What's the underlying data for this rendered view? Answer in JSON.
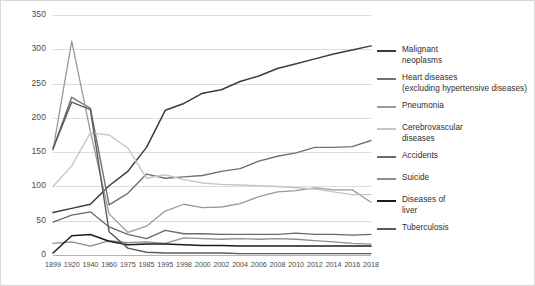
{
  "chart_data": {
    "type": "line",
    "title": "",
    "subtitle": "",
    "xlabel": "",
    "ylabel": "",
    "ylim": [
      0,
      350
    ],
    "yticks": [
      0,
      50,
      100,
      150,
      200,
      250,
      300,
      350
    ],
    "ytick_labels": [
      "0",
      "50",
      "100",
      "150",
      "200",
      "250",
      "300",
      "350"
    ],
    "grid": true,
    "legend_position": "right",
    "x": [
      1899,
      1920,
      1940,
      1960,
      1975,
      1985,
      1995,
      1998,
      2000,
      2002,
      2004,
      2006,
      2008,
      2010,
      2012,
      2014,
      2016,
      2018
    ],
    "categories": [
      "1899",
      "1920",
      "1940",
      "1960",
      "1975",
      "1985",
      "1995",
      "1998",
      "2000",
      "2002",
      "2004",
      "2006",
      "2008",
      "2010",
      "2012",
      "2014",
      "2016",
      "2018"
    ],
    "series": [
      {
        "name": "Malignant neoplasms",
        "color": "#3c3c3c",
        "width": 1.5,
        "values": [
          62,
          68,
          74,
          101,
          122,
          157,
          211,
          221,
          236,
          241,
          253,
          261,
          272,
          279,
          286,
          293,
          299,
          305
        ]
      },
      {
        "name": "Heart diseases (excluding hypertensive diseases)",
        "color": "#707070",
        "width": 1.4,
        "values": [
          155,
          230,
          214,
          73,
          90,
          118,
          112,
          114,
          116,
          122,
          126,
          137,
          144,
          149,
          157,
          157,
          158,
          167
        ]
      },
      {
        "name": "Pneumonia",
        "color": "#9a9a9a",
        "width": 1.3,
        "values": [
          153,
          312,
          180,
          60,
          33,
          42,
          64,
          74,
          69,
          70,
          75,
          85,
          92,
          94,
          98,
          95,
          95,
          77
        ]
      },
      {
        "name": "Cerebrovascular diseases",
        "color": "#c6c6c6",
        "width": 1.4,
        "values": [
          100,
          130,
          178,
          175,
          156,
          112,
          117,
          110,
          105,
          103,
          102,
          101,
          100,
          98,
          96,
          92,
          88,
          88
        ]
      },
      {
        "name": "Accidents",
        "color": "#6a6a6a",
        "width": 1.3,
        "values": [
          48,
          58,
          63,
          41,
          30,
          24,
          36,
          31,
          31,
          30,
          30,
          30,
          30,
          32,
          30,
          30,
          29,
          30
        ]
      },
      {
        "name": "Suicide",
        "color": "#8e8e8e",
        "width": 1.3,
        "values": [
          17,
          19,
          13,
          21,
          18,
          19,
          17,
          25,
          24,
          23,
          24,
          23,
          24,
          23,
          21,
          19,
          17,
          16
        ]
      },
      {
        "name": "Diseases of liver",
        "color": "#1c1c1c",
        "width": 1.5,
        "values": [
          3,
          28,
          30,
          20,
          15,
          16,
          16,
          15,
          14,
          14,
          13,
          13,
          13,
          13,
          13,
          13,
          13,
          13
        ]
      },
      {
        "name": "Tuberculosis",
        "color": "#5a5a5a",
        "width": 1.4,
        "values": [
          155,
          223,
          212,
          34,
          10,
          4,
          3,
          3,
          3,
          3,
          2,
          2,
          2,
          2,
          2,
          2,
          2,
          2
        ]
      }
    ]
  },
  "legend": {
    "items": [
      {
        "label": "Malignant\nneoplasms",
        "color": "#3c3c3c",
        "top": 0
      },
      {
        "label": "Heart diseases\n(excluding hypertensive diseases)",
        "color": "#707070",
        "top": 28
      },
      {
        "label": "Pneumonia",
        "color": "#9a9a9a",
        "top": 56
      },
      {
        "label": "Cerebrovascular\ndiseases",
        "color": "#c6c6c6",
        "top": 78
      },
      {
        "label": "Accidents",
        "color": "#6a6a6a",
        "top": 106
      },
      {
        "label": "Suicide",
        "color": "#8e8e8e",
        "top": 128
      },
      {
        "label": "Diseases of\nliver",
        "color": "#1c1c1c",
        "top": 150
      },
      {
        "label": "Tuberculosis",
        "color": "#5a5a5a",
        "top": 178
      }
    ]
  }
}
